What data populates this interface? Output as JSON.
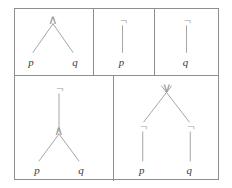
{
  "figure": {
    "operators": {
      "and": "∧",
      "or": "∨",
      "not": "¬"
    },
    "atoms": {
      "p": "p",
      "q": "q"
    },
    "colors": {
      "border": "#8e8e8e",
      "edge": "#9a9a9a",
      "operator": "#9a9a9a",
      "leaf": "#3a3a3a",
      "background": "#ffffff"
    },
    "rows": [
      {
        "name": "top-row",
        "cells": [
          {
            "name": "tree-p-and-q",
            "formula": "p ∧ q",
            "root": "∧",
            "leaves": [
              "p",
              "q"
            ]
          },
          {
            "name": "tree-not-p",
            "formula": "¬p",
            "root": "¬",
            "leaves": [
              "p"
            ]
          },
          {
            "name": "tree-not-q",
            "formula": "¬q",
            "root": "¬",
            "leaves": [
              "q"
            ]
          }
        ]
      },
      {
        "name": "bottom-row",
        "cells": [
          {
            "name": "tree-not-p-and-q",
            "formula": "¬(p ∧ q)",
            "root": "¬",
            "middle": "∧",
            "leaves": [
              "p",
              "q"
            ]
          },
          {
            "name": "tree-not-p-or-not-q",
            "formula": "¬p ∨ ¬q",
            "root": "∨",
            "middle": [
              "¬",
              "¬"
            ],
            "leaves": [
              "p",
              "q"
            ]
          }
        ]
      }
    ]
  }
}
